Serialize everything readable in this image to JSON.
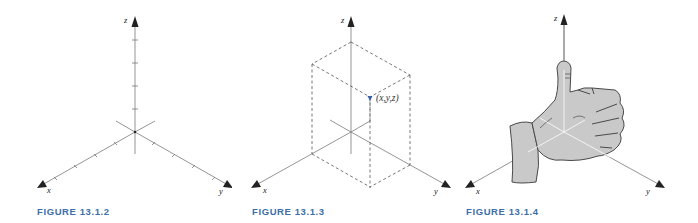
{
  "colors": {
    "axis": "#7a7a7a",
    "arrow": "#222222",
    "caption": "#3d6fa8",
    "point": "#3b5ea8",
    "hand_fill": "#c9c9c9",
    "hand_stroke": "#4a4a4a"
  },
  "figures": [
    {
      "caption": "FIGURE 13.1.2",
      "axes": {
        "x": "x",
        "y": "y",
        "z": "z"
      },
      "description": "Coordinate axes with unit tick marks"
    },
    {
      "caption": "FIGURE 13.1.3",
      "axes": {
        "x": "x",
        "y": "y",
        "z": "z"
      },
      "point_label": "(x,y,z)",
      "description": "Point (x,y,z) shown as corner of dashed rectangular box"
    },
    {
      "caption": "FIGURE 13.1.4",
      "axes": {
        "x": "x",
        "y": "y",
        "z": "z"
      },
      "description": "Right-hand rule: curled fingers from x to y, thumb pointing along z"
    }
  ]
}
